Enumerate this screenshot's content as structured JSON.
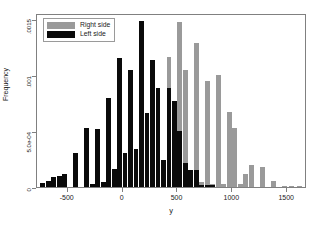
{
  "chart_data": {
    "type": "bar",
    "subtype": "overlapping-histogram",
    "title": "",
    "xlabel": "y",
    "ylabel": "Frequency",
    "xlim": [
      -780,
      1680
    ],
    "ylim": [
      0,
      0.00155
    ],
    "grid": false,
    "bin_width": 50,
    "legend_position": "top-left",
    "xticks": [
      -500,
      0,
      500,
      1000,
      1500
    ],
    "xtick_labels": [
      "-500",
      "0",
      "500",
      "1000",
      "1500"
    ],
    "yticks": [
      0,
      0.0005,
      0.001,
      0.0015
    ],
    "ytick_labels": [
      "0",
      "5.0e-04",
      ".001",
      ".0015"
    ],
    "series": [
      {
        "name": "Right side",
        "color": "#9a9a9a",
        "bins": [
          {
            "x": 200,
            "value": 2.85e-05
          },
          {
            "x": 250,
            "value": 7.55e-05
          },
          {
            "x": 300,
            "value": 9.5e-05
          },
          {
            "x": 350,
            "value": 0.00012
          },
          {
            "x": 400,
            "value": 0.00116
          },
          {
            "x": 450,
            "value": 0.000475
          },
          {
            "x": 500,
            "value": 0.00147
          },
          {
            "x": 550,
            "value": 0.00104
          },
          {
            "x": 600,
            "value": 0.0001
          },
          {
            "x": 650,
            "value": 0.00128
          },
          {
            "x": 700,
            "value": 4.75e-05
          },
          {
            "x": 750,
            "value": 0.00094
          },
          {
            "x": 800,
            "value": 2.85e-05
          },
          {
            "x": 850,
            "value": 0.001
          },
          {
            "x": 900,
            "value": 2.85e-05
          },
          {
            "x": 950,
            "value": 0.00067
          },
          {
            "x": 1000,
            "value": 0.000525
          },
          {
            "x": 1050,
            "value": 2.85e-05
          },
          {
            "x": 1100,
            "value": 0.000115
          },
          {
            "x": 1150,
            "value": 0.0002
          },
          {
            "x": 1250,
            "value": 0.00018
          },
          {
            "x": 1350,
            "value": 5e-05
          },
          {
            "x": 1450,
            "value": 1.2e-05
          },
          {
            "x": 1520,
            "value": 1.2e-05
          },
          {
            "x": 1590,
            "value": 1.2e-05
          }
        ]
      },
      {
        "name": "Left side",
        "color": "#0a0a0a",
        "bins": [
          {
            "x": -750,
            "value": 4e-05
          },
          {
            "x": -700,
            "value": 5e-05
          },
          {
            "x": -650,
            "value": 9e-05
          },
          {
            "x": -600,
            "value": 0.0001
          },
          {
            "x": -550,
            "value": 0.00012
          },
          {
            "x": -450,
            "value": 0.0003
          },
          {
            "x": -350,
            "value": 0.00053
          },
          {
            "x": -300,
            "value": 2.85e-05
          },
          {
            "x": -250,
            "value": 0.00052
          },
          {
            "x": -200,
            "value": 4.75e-05
          },
          {
            "x": -150,
            "value": 0.00079
          },
          {
            "x": -100,
            "value": 0.00016
          },
          {
            "x": -50,
            "value": 0.00115
          },
          {
            "x": 0,
            "value": 0.0003
          },
          {
            "x": 50,
            "value": 0.00104
          },
          {
            "x": 100,
            "value": 0.00034
          },
          {
            "x": 150,
            "value": 0.00148
          },
          {
            "x": 200,
            "value": 0.00066
          },
          {
            "x": 250,
            "value": 0.00113
          },
          {
            "x": 300,
            "value": 0.00088
          },
          {
            "x": 350,
            "value": 0.000245
          },
          {
            "x": 400,
            "value": 0.00088
          },
          {
            "x": 450,
            "value": 0.00077
          },
          {
            "x": 500,
            "value": 0.0005
          },
          {
            "x": 550,
            "value": 0.000215
          },
          {
            "x": 600,
            "value": 0.000155
          },
          {
            "x": 650,
            "value": 0.000155
          },
          {
            "x": 700,
            "value": 2e-05
          },
          {
            "x": 750,
            "value": 2e-05
          },
          {
            "x": 800,
            "value": 2e-05
          }
        ]
      }
    ]
  },
  "legend": {
    "items": [
      {
        "label": "Right side",
        "color": "#9a9a9a"
      },
      {
        "label": "Left side",
        "color": "#0a0a0a"
      }
    ]
  },
  "axes": {
    "x_title": "y",
    "y_title": "Frequency"
  },
  "colors": {
    "right_side": "#9a9a9a",
    "left_side": "#0a0a0a",
    "frame": "#808080",
    "background": "#ffffff"
  }
}
